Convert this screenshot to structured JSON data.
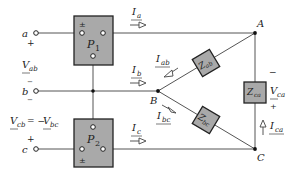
{
  "diagram": {
    "type": "three-phase delta load with two-wattmeter measurement",
    "terminals": {
      "a": {
        "label": "a",
        "sign": "+"
      },
      "b": {
        "label": "b",
        "sign_top": "−",
        "sign_bottom": "−"
      },
      "c": {
        "label": "c",
        "sign": "+"
      }
    },
    "wattmeters": [
      {
        "id": "P1",
        "label": "P",
        "sub": "1",
        "pm": "±"
      },
      {
        "id": "P2",
        "label": "P",
        "sub": "2",
        "pm": "±"
      }
    ],
    "nodes": {
      "A": "A",
      "B": "B",
      "C": "C"
    },
    "impedances": [
      {
        "id": "Zab",
        "label": "Z",
        "sub": "ab"
      },
      {
        "id": "Zbc",
        "label": "Z",
        "sub": "bc"
      },
      {
        "id": "Zca",
        "label": "Z",
        "sub": "ca"
      }
    ],
    "currents": [
      {
        "id": "Ia",
        "label": "I",
        "sub": "a"
      },
      {
        "id": "Ib",
        "label": "I",
        "sub": "b"
      },
      {
        "id": "Ic",
        "label": "I",
        "sub": "c"
      },
      {
        "id": "Iab",
        "label": "I",
        "sub": "ab"
      },
      {
        "id": "Ibc",
        "label": "I",
        "sub": "bc"
      },
      {
        "id": "Ica",
        "label": "I",
        "sub": "ca"
      }
    ],
    "voltages": {
      "Vab": {
        "label": "V",
        "sub": "ab"
      },
      "Vcb_eq": {
        "lhs": "V",
        "lhs_sub": "cb",
        "eq": " = −",
        "rhs": "V",
        "rhs_sub": "bc"
      },
      "Vca": {
        "label": "V",
        "sub": "ca",
        "top_sign": "−",
        "bottom_sign": "+"
      }
    }
  }
}
